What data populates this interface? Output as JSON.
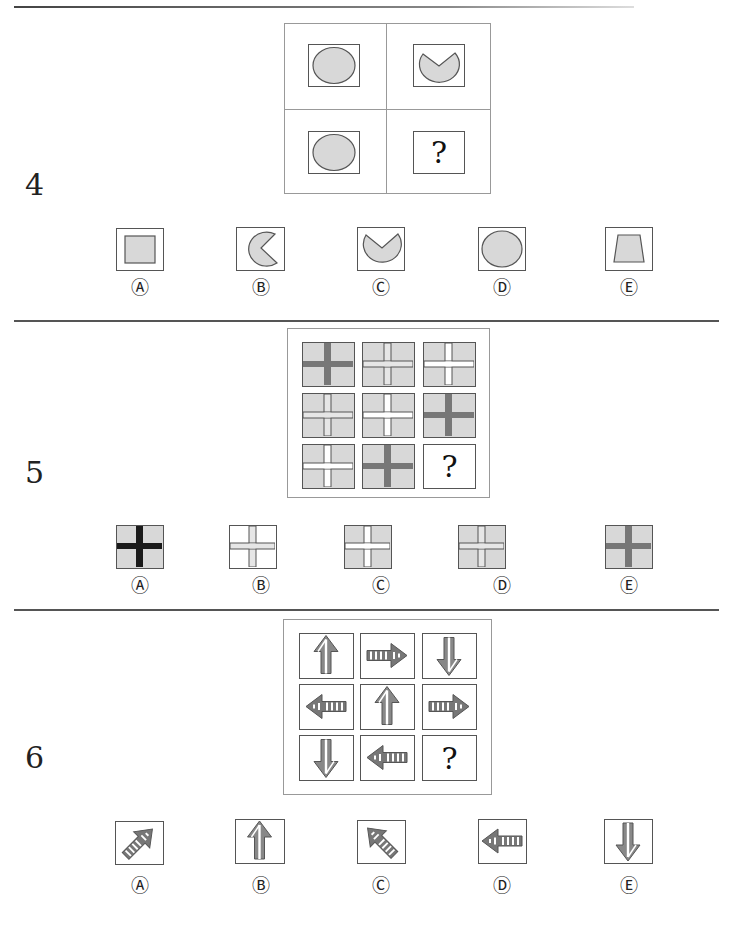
{
  "questions": [
    {
      "number": "4",
      "prompt_grid": {
        "rows": 2,
        "cols": 2,
        "cells": [
          "circle",
          "circle-notch-top",
          "circle",
          "?"
        ]
      },
      "options": [
        {
          "label": "Ⓐ",
          "shape": "square"
        },
        {
          "label": "Ⓑ",
          "shape": "pacman-right-notch"
        },
        {
          "label": "Ⓒ",
          "shape": "circle-notch-top"
        },
        {
          "label": "Ⓓ",
          "shape": "circle"
        },
        {
          "label": "Ⓔ",
          "shape": "trapezoid"
        }
      ]
    },
    {
      "number": "5",
      "prompt_grid": {
        "rows": 3,
        "cols": 3,
        "cells": [
          "cross-dark-gray-bg",
          "cross-light-gray-bg",
          "cross-white-gray-bg",
          "cross-light-gray-bg",
          "cross-white-gray-bg",
          "cross-dark-gray-bg",
          "cross-white-gray-bg",
          "cross-dark-gray-bg",
          "?"
        ]
      },
      "options": [
        {
          "label": "Ⓐ",
          "shape": "cross-black-gray-bg"
        },
        {
          "label": "Ⓑ",
          "shape": "cross-light-white-bg"
        },
        {
          "label": "Ⓒ",
          "shape": "cross-white-gray-bg"
        },
        {
          "label": "Ⓓ",
          "shape": "cross-light-gray-bg"
        },
        {
          "label": "Ⓔ",
          "shape": "cross-dark-gray-bg"
        }
      ]
    },
    {
      "number": "6",
      "prompt_grid": {
        "rows": 3,
        "cols": 3,
        "cells": [
          "arrow-up",
          "arrow-right",
          "arrow-down",
          "arrow-left",
          "arrow-up",
          "arrow-right",
          "arrow-down",
          "arrow-left",
          "?"
        ]
      },
      "options": [
        {
          "label": "Ⓐ",
          "shape": "arrow-up-right"
        },
        {
          "label": "Ⓑ",
          "shape": "arrow-up"
        },
        {
          "label": "Ⓒ",
          "shape": "arrow-up-left"
        },
        {
          "label": "Ⓓ",
          "shape": "arrow-left"
        },
        {
          "label": "Ⓔ",
          "shape": "arrow-down"
        }
      ]
    }
  ],
  "question_mark": "?",
  "colors": {
    "shape_fill": "#d8d8d8",
    "shape_stroke": "#555555",
    "cross_dark": "#777777",
    "cross_black": "#1a1a1a",
    "cross_light": "#e4e4e4",
    "divider": "#555555"
  }
}
